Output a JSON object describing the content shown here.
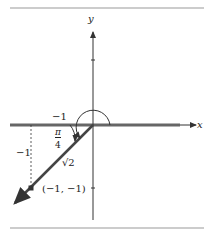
{
  "diagram": {
    "axis_x_label": "x",
    "axis_y_label": "y",
    "label_neg1_horizontal": "−1",
    "label_neg1_vertical": "−1",
    "angle_num": "π",
    "angle_den": "4",
    "hypotenuse": "√2",
    "point_label": "(−1, −1)",
    "colors": {
      "axis": "#555555",
      "ray": "#444444",
      "thin": "#333333"
    }
  }
}
